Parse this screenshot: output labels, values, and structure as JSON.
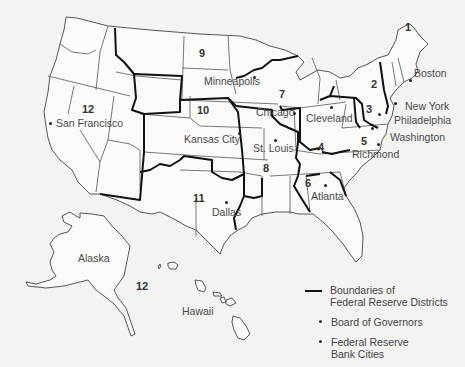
{
  "map": {
    "title": "Federal Reserve Districts",
    "background_color": "#f3f3f1",
    "boundary_color": "#111111",
    "state_line_color": "#555555"
  },
  "districts": [
    {
      "number": "1",
      "city": "Boston"
    },
    {
      "number": "2",
      "city": "New York"
    },
    {
      "number": "3",
      "city": "Philadelphia"
    },
    {
      "number": "4",
      "city": "Cleveland"
    },
    {
      "number": "5",
      "city": "Richmond"
    },
    {
      "number": "6",
      "city": "Atlanta"
    },
    {
      "number": "7",
      "city": "Chicago"
    },
    {
      "number": "8",
      "city": "St. Louis"
    },
    {
      "number": "9",
      "city": "Minneapolis"
    },
    {
      "number": "10",
      "city": "Kansas City"
    },
    {
      "number": "11",
      "city": "Dallas"
    },
    {
      "number": "12",
      "city": "San Francisco"
    }
  ],
  "extra_labels": {
    "pacific_district_number": "12",
    "board_city": "Washington",
    "alaska": "Alaska",
    "hawaii": "Hawaii"
  },
  "legend": {
    "boundaries_line1": "Boundaries of",
    "boundaries_line2": "Federal Reserve Districts",
    "board": "Board of Governors",
    "bank_cities_line1": "Federal Reserve",
    "bank_cities_line2": "Bank Cities"
  }
}
